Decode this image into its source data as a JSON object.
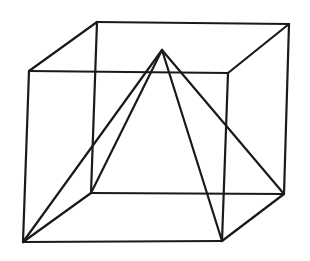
{
  "diagram": {
    "stroke_color": "#1a1a1a",
    "background": "#ffffff",
    "vertices": {
      "front_tl": [
        29,
        71
      ],
      "front_tr": [
        228,
        73
      ],
      "front_bl": [
        23,
        242
      ],
      "front_br": [
        222,
        241
      ],
      "back_tl": [
        97,
        22
      ],
      "back_tr": [
        289,
        24
      ],
      "back_bl": [
        91,
        193
      ],
      "back_br": [
        284,
        194
      ],
      "apex": [
        162,
        50
      ]
    },
    "edges": [
      {
        "name": "cube-front-top",
        "from": "front_tl",
        "to": "front_tr"
      },
      {
        "name": "cube-front-bottom",
        "from": "front_bl",
        "to": "front_br"
      },
      {
        "name": "cube-front-left",
        "from": "front_tl",
        "to": "front_bl"
      },
      {
        "name": "cube-front-right",
        "from": "front_tr",
        "to": "front_br"
      },
      {
        "name": "cube-back-top",
        "from": "back_tl",
        "to": "back_tr"
      },
      {
        "name": "cube-back-bottom",
        "from": "back_bl",
        "to": "back_br"
      },
      {
        "name": "cube-back-left",
        "from": "back_tl",
        "to": "back_bl"
      },
      {
        "name": "cube-back-right",
        "from": "back_tr",
        "to": "back_br"
      },
      {
        "name": "cube-depth-tl",
        "from": "front_tl",
        "to": "back_tl"
      },
      {
        "name": "cube-depth-tr",
        "from": "front_tr",
        "to": "back_tr"
      },
      {
        "name": "cube-depth-bl",
        "from": "front_bl",
        "to": "back_bl"
      },
      {
        "name": "cube-depth-br",
        "from": "front_br",
        "to": "back_br"
      },
      {
        "name": "pyramid-edge-front-left",
        "from": "apex",
        "to": "front_bl"
      },
      {
        "name": "pyramid-edge-back-left",
        "from": "apex",
        "to": "back_bl"
      },
      {
        "name": "pyramid-edge-front-right",
        "from": "apex",
        "to": "front_br"
      },
      {
        "name": "pyramid-edge-back-right",
        "from": "apex",
        "to": "back_br"
      }
    ]
  }
}
